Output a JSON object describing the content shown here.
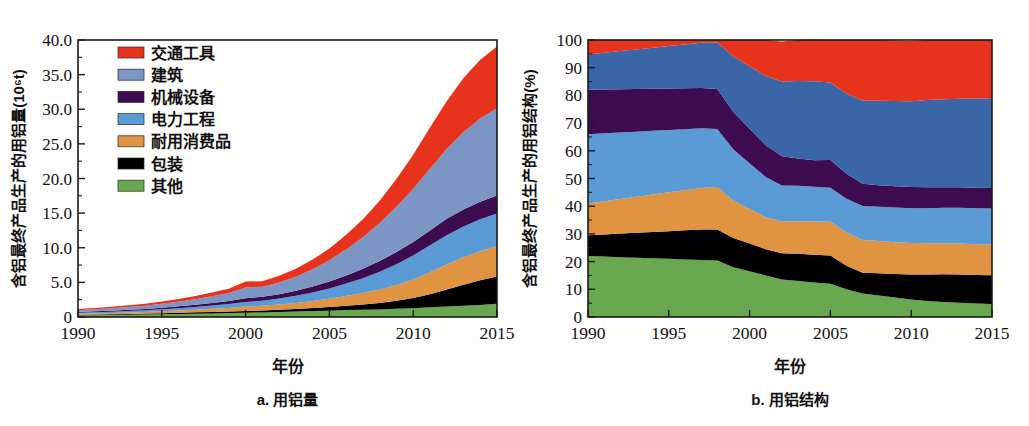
{
  "figure": {
    "background": "#fdfdfb",
    "panels": [
      {
        "key": "a",
        "caption": "a. 用铝量"
      },
      {
        "key": "b",
        "caption": "b. 用铝结构"
      }
    ]
  },
  "legend": {
    "position": "top-left-of-panel-a",
    "items": [
      {
        "label": "交通工具",
        "color": "#e8331c"
      },
      {
        "label": "建筑",
        "color": "#7b96c4"
      },
      {
        "label": "机械设备",
        "color": "#3d0b50"
      },
      {
        "label": "电力工程",
        "color": "#5b9bd5"
      },
      {
        "label": "耐用消费品",
        "color": "#e09340"
      },
      {
        "label": "包装",
        "color": "#000000"
      },
      {
        "label": "其他",
        "color": "#6aa84f"
      }
    ]
  },
  "chart_data": [
    {
      "type": "area",
      "stacked": true,
      "panel": "a",
      "title": "a. 用铝量",
      "xlabel": "年份",
      "ylabel": "含铝最终产品生产的用铝量(10⁶t)",
      "grid": false,
      "legend_position": "inside-top-left",
      "xlim": [
        1990,
        2015
      ],
      "ylim": [
        0,
        40
      ],
      "xticks": [
        1990,
        1995,
        2000,
        2005,
        2010,
        2015
      ],
      "xticklabels": [
        "1990",
        "1995",
        "2000",
        "2005",
        "2010",
        "2015"
      ],
      "yticks": [
        0,
        5,
        10,
        15,
        20,
        25,
        30,
        35,
        40
      ],
      "yticklabels": [
        "0",
        "5.0",
        "10.0",
        "15.0",
        "20.0",
        "25.0",
        "30.0",
        "35.0",
        "40.0"
      ],
      "x": [
        1990,
        1991,
        1992,
        1993,
        1994,
        1995,
        1996,
        1997,
        1998,
        1999,
        2000,
        2001,
        2002,
        2003,
        2004,
        2005,
        2006,
        2007,
        2008,
        2009,
        2010,
        2011,
        2012,
        2013,
        2014,
        2015
      ],
      "series": [
        {
          "name": "其他",
          "color": "#6aa84f",
          "values": [
            0.25,
            0.27,
            0.3,
            0.33,
            0.36,
            0.4,
            0.44,
            0.48,
            0.52,
            0.56,
            0.62,
            0.66,
            0.72,
            0.78,
            0.85,
            0.92,
            1.0,
            1.05,
            1.1,
            1.18,
            1.28,
            1.4,
            1.52,
            1.62,
            1.75,
            1.9
          ]
        },
        {
          "name": "包装",
          "color": "#000000",
          "values": [
            0.09,
            0.1,
            0.11,
            0.12,
            0.13,
            0.15,
            0.17,
            0.19,
            0.21,
            0.23,
            0.26,
            0.29,
            0.33,
            0.38,
            0.45,
            0.53,
            0.63,
            0.75,
            0.92,
            1.15,
            1.45,
            1.9,
            2.45,
            3.05,
            3.55,
            3.95
          ]
        },
        {
          "name": "耐用消费品",
          "color": "#e09340",
          "values": [
            0.13,
            0.15,
            0.17,
            0.2,
            0.23,
            0.27,
            0.32,
            0.38,
            0.45,
            0.52,
            0.62,
            0.66,
            0.74,
            0.85,
            1.0,
            1.18,
            1.4,
            1.65,
            1.95,
            2.3,
            2.7,
            3.15,
            3.6,
            3.95,
            4.2,
            4.4
          ]
        },
        {
          "name": "电力工程",
          "color": "#5b9bd5",
          "values": [
            0.15,
            0.17,
            0.19,
            0.22,
            0.25,
            0.29,
            0.34,
            0.4,
            0.47,
            0.55,
            0.68,
            0.74,
            0.88,
            1.05,
            1.25,
            1.5,
            1.8,
            2.15,
            2.55,
            3.0,
            3.45,
            3.9,
            4.25,
            4.45,
            4.6,
            4.7
          ]
        },
        {
          "name": "机械设备",
          "color": "#3d0b50",
          "values": [
            0.12,
            0.13,
            0.15,
            0.17,
            0.2,
            0.23,
            0.27,
            0.32,
            0.38,
            0.44,
            0.54,
            0.56,
            0.63,
            0.72,
            0.85,
            1.0,
            1.18,
            1.35,
            1.55,
            1.75,
            1.95,
            2.15,
            2.35,
            2.45,
            2.55,
            2.6
          ]
        },
        {
          "name": "建筑",
          "color": "#7b96c4",
          "values": [
            0.25,
            0.29,
            0.34,
            0.4,
            0.47,
            0.56,
            0.66,
            0.8,
            0.96,
            1.15,
            1.55,
            1.45,
            1.7,
            2.05,
            2.5,
            3.05,
            3.75,
            4.55,
            5.5,
            6.55,
            7.7,
            8.9,
            10.1,
            11.2,
            12.0,
            12.6
          ]
        },
        {
          "name": "交通工具",
          "color": "#e8331c",
          "values": [
            0.16,
            0.18,
            0.21,
            0.24,
            0.28,
            0.33,
            0.39,
            0.46,
            0.54,
            0.64,
            0.85,
            0.8,
            0.95,
            1.15,
            1.4,
            1.7,
            2.1,
            2.6,
            3.2,
            4.0,
            4.9,
            5.95,
            6.9,
            7.8,
            8.5,
            8.9
          ]
        }
      ]
    },
    {
      "type": "area",
      "stacked": true,
      "panel": "b",
      "title": "b. 用铝结构",
      "xlabel": "年份",
      "ylabel": "含铝最终产品生产的用铝结构(%)",
      "grid": false,
      "legend_position": "shared-with-panel-a",
      "xlim": [
        1990,
        2015
      ],
      "ylim": [
        0,
        100
      ],
      "xticks": [
        1990,
        1995,
        2000,
        2005,
        2010,
        2015
      ],
      "xticklabels": [
        "1990",
        "1995",
        "2000",
        "2005",
        "2010",
        "2015"
      ],
      "yticks": [
        0,
        10,
        20,
        30,
        40,
        50,
        60,
        70,
        80,
        90,
        100
      ],
      "yticklabels": [
        "0",
        "10",
        "20",
        "30",
        "40",
        "50",
        "60",
        "70",
        "80",
        "90",
        "100"
      ],
      "x": [
        1990,
        1991,
        1992,
        1993,
        1994,
        1995,
        1996,
        1997,
        1998,
        1999,
        2000,
        2001,
        2002,
        2003,
        2004,
        2005,
        2006,
        2007,
        2008,
        2009,
        2010,
        2011,
        2012,
        2013,
        2014,
        2015
      ],
      "series": [
        {
          "name": "其他",
          "color": "#6aa84f",
          "values": [
            22.0,
            21.8,
            21.6,
            21.4,
            21.2,
            21.0,
            20.8,
            20.6,
            20.4,
            18.0,
            16.5,
            15.0,
            13.5,
            13.0,
            12.5,
            12.0,
            10.0,
            8.5,
            7.8,
            7.0,
            6.3,
            5.8,
            5.4,
            5.1,
            4.9,
            4.7
          ]
        },
        {
          "name": "包装",
          "color": "#000000",
          "values": [
            7.5,
            8.0,
            8.5,
            9.0,
            9.5,
            10.0,
            10.5,
            11.0,
            11.2,
            10.5,
            10.0,
            9.5,
            9.5,
            9.8,
            10.0,
            10.2,
            8.5,
            7.5,
            8.0,
            8.5,
            9.0,
            9.5,
            10.0,
            10.2,
            10.3,
            10.4
          ]
        },
        {
          "name": "耐用消费品",
          "color": "#e09340",
          "values": [
            11.5,
            12.0,
            12.5,
            13.0,
            13.5,
            14.0,
            14.5,
            15.0,
            15.3,
            13.5,
            12.5,
            11.5,
            11.5,
            11.8,
            12.0,
            12.2,
            12.0,
            11.8,
            11.6,
            11.5,
            11.4,
            11.3,
            11.2,
            11.2,
            11.1,
            11.0
          ]
        },
        {
          "name": "电力工程",
          "color": "#5b9bd5",
          "values": [
            25.0,
            24.5,
            24.0,
            23.5,
            23.0,
            22.5,
            22.0,
            21.5,
            21.0,
            18.5,
            16.5,
            14.5,
            13.0,
            12.8,
            12.5,
            12.3,
            12.2,
            12.3,
            12.4,
            12.5,
            12.6,
            12.7,
            12.8,
            12.9,
            13.0,
            13.1
          ]
        },
        {
          "name": "机械设备",
          "color": "#3d0b50",
          "values": [
            16.0,
            15.8,
            15.6,
            15.4,
            15.2,
            15.0,
            14.8,
            14.6,
            14.4,
            13.5,
            12.5,
            11.5,
            10.5,
            9.8,
            9.6,
            10.0,
            9.0,
            8.0,
            7.8,
            7.7,
            7.6,
            7.5,
            7.4,
            7.4,
            7.4,
            7.4
          ]
        },
        {
          "name": "建筑",
          "color": "#3a66a8",
          "values": [
            12.8,
            13.3,
            13.8,
            14.3,
            14.8,
            15.3,
            15.8,
            16.3,
            16.8,
            20.0,
            22.5,
            25.0,
            27.0,
            28.0,
            28.5,
            28.0,
            29.0,
            30.0,
            30.5,
            30.8,
            31.0,
            31.5,
            31.8,
            32.0,
            32.2,
            32.4
          ]
        },
        {
          "name": "交通工具",
          "color": "#e8331c",
          "values": [
            5.2,
            4.6,
            4.0,
            3.4,
            2.8,
            2.2,
            1.6,
            1.0,
            0.9,
            6.0,
            9.5,
            13.0,
            14.5,
            14.8,
            15.1,
            15.3,
            19.3,
            21.9,
            21.9,
            21.8,
            21.7,
            21.7,
            21.4,
            21.2,
            21.1,
            21.0
          ]
        }
      ]
    }
  ]
}
